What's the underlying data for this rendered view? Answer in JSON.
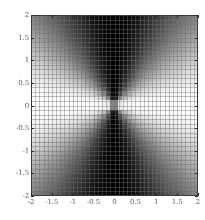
{
  "figure": {
    "width": 205,
    "height": 220,
    "background_color": "#ffffff",
    "frame_color": "#3a3a3a",
    "tick_label_color": "#5a5a5a"
  },
  "plot": {
    "left": 31,
    "top": 15,
    "width": 167,
    "height": 181
  },
  "chart_data": {
    "type": "heatmap",
    "title": "",
    "subtitle": "",
    "xlabel": "",
    "ylabel": "",
    "xlim": [
      -2,
      2
    ],
    "ylim": [
      -2,
      2
    ],
    "grid": true,
    "mesh": true,
    "mesh_divisions": 40,
    "legend": null,
    "colormap": "grayscale",
    "colormap_range": [
      "#000000",
      "#ffffff"
    ],
    "value_range": [
      0,
      1
    ],
    "function": "|cos(theta)| = |x| / sqrt(x^2 + y^2)",
    "xticks": [
      -2,
      -1.5,
      -1,
      -0.5,
      0,
      0.5,
      1,
      1.5,
      2
    ],
    "xticklabels": [
      "-2",
      "-1.5",
      "-1",
      "-0.5",
      "0",
      "0.5",
      "1",
      "1.5",
      "2"
    ],
    "yticks": [
      -2,
      -1.5,
      -1,
      -0.5,
      0,
      0.5,
      1,
      1.5,
      2
    ],
    "yticklabels": [
      "-2",
      "-1.5",
      "-1",
      "-0.5",
      "0",
      "0.5",
      "1",
      "1.5",
      "2"
    ],
    "sampled_values": [
      {
        "x": -2.0,
        "y": 0.0,
        "value": 1.0
      },
      {
        "x": -1.0,
        "y": 0.0,
        "value": 1.0
      },
      {
        "x": -0.5,
        "y": 0.0,
        "value": 1.0
      },
      {
        "x": 0.0,
        "y": 0.0,
        "value": 1.0
      },
      {
        "x": 0.5,
        "y": 0.0,
        "value": 1.0
      },
      {
        "x": 1.0,
        "y": 0.0,
        "value": 1.0
      },
      {
        "x": 2.0,
        "y": 0.0,
        "value": 1.0
      },
      {
        "x": 0.0,
        "y": 2.0,
        "value": 0.0
      },
      {
        "x": 0.0,
        "y": 1.0,
        "value": 0.0
      },
      {
        "x": 0.0,
        "y": -1.0,
        "value": 0.0
      },
      {
        "x": 0.0,
        "y": -2.0,
        "value": 0.0
      },
      {
        "x": -2.0,
        "y": 2.0,
        "value": 0.707
      },
      {
        "x": 2.0,
        "y": 2.0,
        "value": 0.707
      },
      {
        "x": -2.0,
        "y": -2.0,
        "value": 0.707
      },
      {
        "x": 2.0,
        "y": -2.0,
        "value": 0.707
      },
      {
        "x": 2.0,
        "y": 1.0,
        "value": 0.894
      },
      {
        "x": 1.0,
        "y": 2.0,
        "value": 0.447
      },
      {
        "x": -2.0,
        "y": 1.0,
        "value": 0.894
      },
      {
        "x": -1.0,
        "y": 2.0,
        "value": 0.447
      }
    ]
  }
}
